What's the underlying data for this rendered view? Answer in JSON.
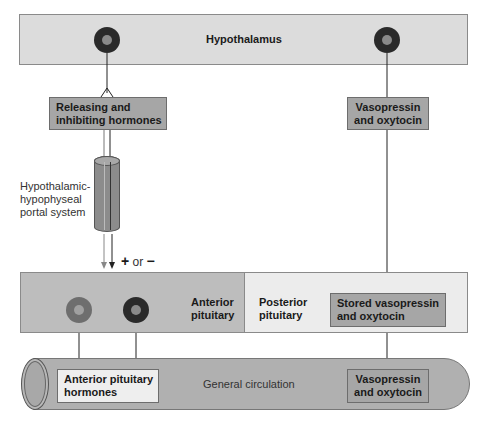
{
  "hypothalamus": {
    "label": "Hypothalamus"
  },
  "releasing_box": {
    "line1": "Releasing and",
    "line2": "inhibiting hormones"
  },
  "vasopressin_box": {
    "line1": "Vasopressin",
    "line2": "and oxytocin"
  },
  "portal_system": {
    "line1": "Hypothalamic-",
    "line2": "hypophyseal",
    "line3": "portal system"
  },
  "effect": {
    "plus": "+",
    "or": "or",
    "minus": "−"
  },
  "anterior_pituitary": {
    "line1": "Anterior",
    "line2": "pituitary"
  },
  "posterior_pituitary": {
    "line1": "Posterior",
    "line2": "pituitary"
  },
  "stored_box": {
    "line1": "Stored vasopressin",
    "line2": "and oxytocin"
  },
  "circulation": {
    "label": "General circulation"
  },
  "anterior_hormones_box": {
    "line1": "Anterior pituitary",
    "line2": "hormones"
  },
  "circulation_vasopressin_box": {
    "line1": "Vasopressin",
    "line2": "and oxytocin"
  },
  "colors": {
    "hypothalamus_fill": "#dcdcdc",
    "box_fill": "#a6a6a6",
    "anterior_fill": "#bdbdbd",
    "posterior_fill": "#ececec",
    "tube_fill": "#b0b0b0",
    "light_box_fill": "#eeeeee"
  }
}
